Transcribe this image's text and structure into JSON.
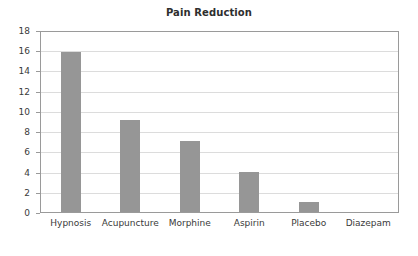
{
  "chart_data": {
    "type": "bar",
    "title": "Pain Reduction",
    "xlabel": "",
    "ylabel": "",
    "categories": [
      "Hypnosis",
      "Acupuncture",
      "Morphine",
      "Aspirin",
      "Placebo",
      "Diazepam"
    ],
    "values": [
      16,
      9.2,
      7.1,
      4,
      1,
      0
    ],
    "ylim": [
      0,
      18
    ],
    "ytick_labels": [
      "0",
      "2",
      "4",
      "6",
      "8",
      "10",
      "12",
      "14",
      "16",
      "18"
    ],
    "ytick_values": [
      0,
      2,
      4,
      6,
      8,
      10,
      12,
      14,
      16,
      18
    ],
    "grid": true,
    "legend": false,
    "bar_color": "#969696",
    "grid_color": "#dcdcdc",
    "axis_color": "#9a9a9a",
    "background_color": "#ffffff",
    "text_color": "#3a3a3a"
  }
}
